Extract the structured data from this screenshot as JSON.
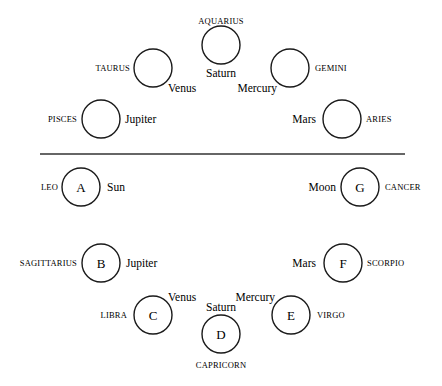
{
  "diagram": {
    "top_section": {
      "nodes": [
        {
          "id": "aquarius",
          "cx": 221,
          "cy": 45,
          "r": 19,
          "letter": "",
          "sign": "AQUARIUS",
          "planet": "Saturn",
          "sign_pos": {
            "x": 221,
            "y": 24,
            "anchor": "middle"
          },
          "planet_pos": {
            "x": 221,
            "y": 77,
            "anchor": "middle"
          }
        },
        {
          "id": "taurus",
          "cx": 153,
          "cy": 68,
          "r": 19,
          "letter": "",
          "sign": "TAURUS",
          "planet": "Venus",
          "sign_pos": {
            "x": 130,
            "y": 71,
            "anchor": "end"
          },
          "planet_pos": {
            "x": 168,
            "y": 92,
            "anchor": "start"
          }
        },
        {
          "id": "gemini",
          "cx": 290,
          "cy": 68,
          "r": 19,
          "letter": "",
          "sign": "GEMINI",
          "planet": "Mercury",
          "sign_pos": {
            "x": 315,
            "y": 71,
            "anchor": "start"
          },
          "planet_pos": {
            "x": 277,
            "y": 92,
            "anchor": "end"
          }
        },
        {
          "id": "pisces",
          "cx": 101,
          "cy": 119,
          "r": 19,
          "letter": "",
          "sign": "PISCES",
          "planet": "Jupiter",
          "sign_pos": {
            "x": 77,
            "y": 122,
            "anchor": "end"
          },
          "planet_pos": {
            "x": 125,
            "y": 123,
            "anchor": "start"
          }
        },
        {
          "id": "aries",
          "cx": 342,
          "cy": 119,
          "r": 19,
          "letter": "",
          "sign": "ARIES",
          "planet": "Mars",
          "sign_pos": {
            "x": 366,
            "y": 122,
            "anchor": "start"
          },
          "planet_pos": {
            "x": 316,
            "y": 123,
            "anchor": "end"
          }
        }
      ]
    },
    "divider": {
      "x1": 40,
      "x2": 405,
      "y": 154
    },
    "bottom_section": {
      "nodes": [
        {
          "id": "A",
          "cx": 81,
          "cy": 187,
          "r": 19,
          "letter": "A",
          "sign": "LEO",
          "planet": "Sun",
          "sign_pos": {
            "x": 58,
            "y": 190,
            "anchor": "end"
          },
          "planet_pos": {
            "x": 107,
            "y": 191,
            "anchor": "start"
          }
        },
        {
          "id": "G",
          "cx": 360,
          "cy": 187,
          "r": 19,
          "letter": "G",
          "sign": "CANCER",
          "planet": "Moon",
          "sign_pos": {
            "x": 385,
            "y": 190,
            "anchor": "start"
          },
          "planet_pos": {
            "x": 336,
            "y": 191,
            "anchor": "end"
          }
        },
        {
          "id": "B",
          "cx": 101,
          "cy": 263,
          "r": 19,
          "letter": "B",
          "sign": "SAGITTARIUS",
          "planet": "Jupiter",
          "sign_pos": {
            "x": 77,
            "y": 266,
            "anchor": "end"
          },
          "planet_pos": {
            "x": 126,
            "y": 267,
            "anchor": "start"
          }
        },
        {
          "id": "F",
          "cx": 343,
          "cy": 263,
          "r": 19,
          "letter": "F",
          "sign": "SCORPIO",
          "planet": "Mars",
          "sign_pos": {
            "x": 367,
            "y": 266,
            "anchor": "start"
          },
          "planet_pos": {
            "x": 316,
            "y": 267,
            "anchor": "end"
          }
        },
        {
          "id": "C",
          "cx": 153,
          "cy": 315,
          "r": 19,
          "letter": "C",
          "sign": "LIBRA",
          "planet": "Venus",
          "sign_pos": {
            "x": 127,
            "y": 318,
            "anchor": "end"
          },
          "planet_pos": {
            "x": 168,
            "y": 301,
            "anchor": "start"
          }
        },
        {
          "id": "E",
          "cx": 291,
          "cy": 315,
          "r": 19,
          "letter": "E",
          "sign": "VIRGO",
          "planet": "Mercury",
          "sign_pos": {
            "x": 317,
            "y": 318,
            "anchor": "start"
          },
          "planet_pos": {
            "x": 275,
            "y": 301,
            "anchor": "end"
          }
        },
        {
          "id": "D",
          "cx": 221,
          "cy": 334,
          "r": 19,
          "letter": "D",
          "sign": "CAPRICORN",
          "planet": "Saturn",
          "sign_pos": {
            "x": 221,
            "y": 368,
            "anchor": "middle"
          },
          "planet_pos": {
            "x": 221,
            "y": 311,
            "anchor": "middle"
          }
        }
      ]
    }
  }
}
